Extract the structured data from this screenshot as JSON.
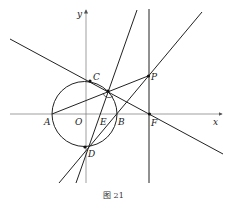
{
  "figure": {
    "caption": "图 21",
    "axes": {
      "x_label": "x",
      "y_label": "y",
      "origin_label": "O"
    },
    "points": {
      "A": "A",
      "B": "B",
      "C": "C",
      "D": "D",
      "E": "E",
      "F": "F",
      "P": "P",
      "O": "O"
    },
    "colors": {
      "stroke": "#222222",
      "axis": "#666666",
      "background": "#ffffff"
    }
  }
}
